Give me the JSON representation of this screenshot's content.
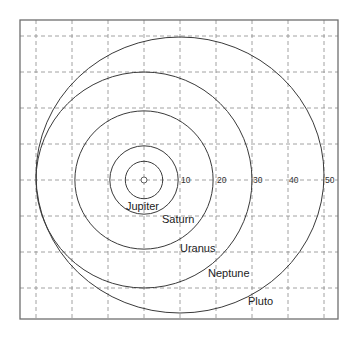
{
  "diagram": {
    "scale_unit": "AU",
    "distance_ticks": [
      "10",
      "20",
      "30",
      "40",
      "50"
    ],
    "center_object": "sun",
    "orbits": [
      {
        "name": "Jupiter",
        "label": "Jupiter",
        "distance_au": 5.2
      },
      {
        "name": "Saturn",
        "label": "Saturn",
        "distance_au": 9.5
      },
      {
        "name": "Uranus",
        "label": "Uranus",
        "distance_au": 19.2
      },
      {
        "name": "Neptune",
        "label": "Neptune",
        "distance_au": 30.0
      },
      {
        "name": "Pluto",
        "label": "Pluto",
        "semi_major_au": 40,
        "eccentric": true
      }
    ]
  }
}
